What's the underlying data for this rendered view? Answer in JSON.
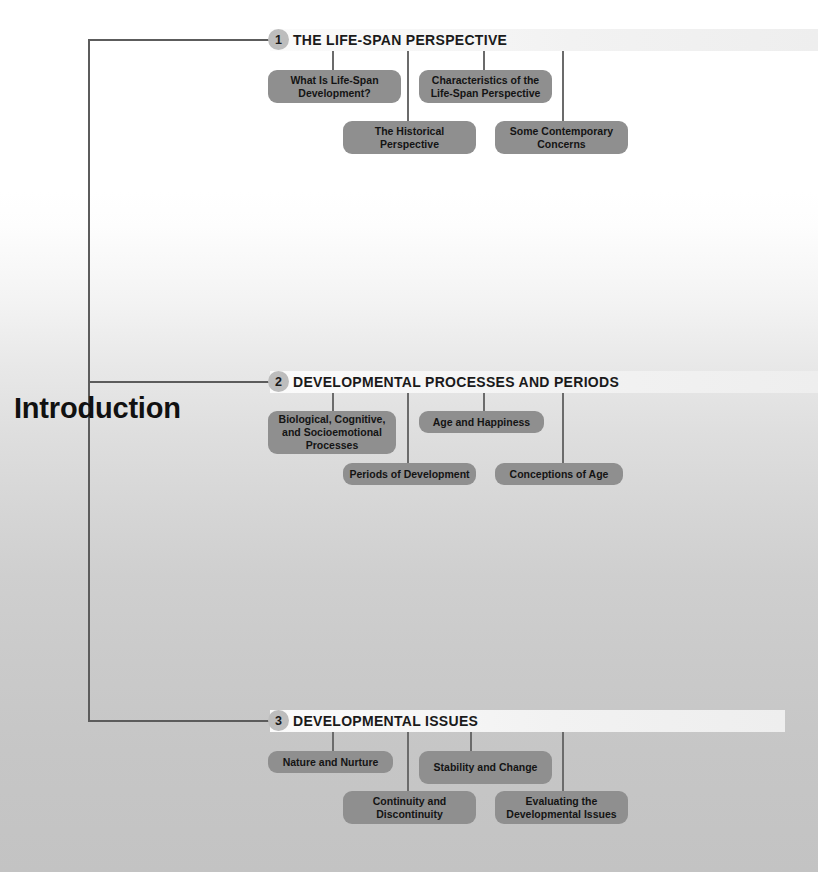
{
  "page": {
    "title": "Introduction"
  },
  "sections": [
    {
      "number": "1",
      "title": "THE LIFE-SPAN PERSPECTIVE",
      "topics": [
        "What Is Life-Span Development?",
        "Characteristics of the Life-Span Perspective",
        "The Historical Perspective",
        "Some Contemporary Concerns"
      ]
    },
    {
      "number": "2",
      "title": "DEVELOPMENTAL PROCESSES AND PERIODS",
      "topics": [
        "Biological, Cognitive, and Socioemotional Processes",
        "Age and Happiness",
        "Periods of Development",
        "Conceptions of Age"
      ]
    },
    {
      "number": "3",
      "title": "DEVELOPMENTAL ISSUES",
      "topics": [
        "Nature and Nurture",
        "Stability and Change",
        "Continuity and Discontinuity",
        "Evaluating the Developmental Issues"
      ]
    }
  ],
  "colors": {
    "topic_box": "#8f8f8f",
    "section_bar": "#f2f2f2",
    "number_circle": "#bdbdbd",
    "line": "#5c5c5c",
    "text": "#141414"
  }
}
